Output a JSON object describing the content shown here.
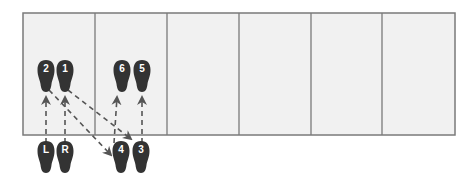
{
  "diagram": {
    "colors": {
      "panel_fill": "#f1f1f1",
      "grid_line": "#7a7a7a",
      "foot": "#333333",
      "foot_label": "#ffffff",
      "arrow": "#555555"
    },
    "grid": {
      "columns": 6
    },
    "footprints": [
      {
        "id": "L",
        "label": "L",
        "x": 46,
        "y": 157
      },
      {
        "id": "R",
        "label": "R",
        "x": 65,
        "y": 157
      },
      {
        "id": "1",
        "label": "1",
        "x": 65,
        "y": 76
      },
      {
        "id": "2",
        "label": "2",
        "x": 46,
        "y": 76
      },
      {
        "id": "3",
        "label": "3",
        "x": 141,
        "y": 157
      },
      {
        "id": "4",
        "label": "4",
        "x": 121,
        "y": 157
      },
      {
        "id": "5",
        "label": "5",
        "x": 142,
        "y": 76
      },
      {
        "id": "6",
        "label": "6",
        "x": 122,
        "y": 76
      }
    ],
    "moves": [
      {
        "from": "L",
        "to": "2"
      },
      {
        "from": "R",
        "to": "1"
      },
      {
        "from": "1",
        "to": "3"
      },
      {
        "from": "2",
        "to": "4"
      },
      {
        "from": "4",
        "to": "6"
      },
      {
        "from": "3",
        "to": "5"
      }
    ]
  }
}
